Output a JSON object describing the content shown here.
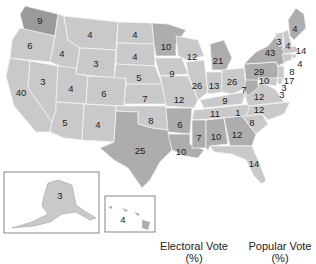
{
  "colors": {
    "light": "#c9c9c9",
    "medium": "#adadad",
    "dark": "#9a9a9a",
    "border": "#f2f2f2",
    "text": "#222222"
  },
  "states": [
    {
      "id": "WA",
      "votes": "9"
    },
    {
      "id": "OR",
      "votes": "6"
    },
    {
      "id": "CA",
      "votes": "40"
    },
    {
      "id": "ID",
      "votes": "4"
    },
    {
      "id": "NV",
      "votes": "3"
    },
    {
      "id": "MT",
      "votes": "4"
    },
    {
      "id": "WY",
      "votes": "3"
    },
    {
      "id": "UT",
      "votes": "4"
    },
    {
      "id": "CO",
      "votes": "6"
    },
    {
      "id": "AZ",
      "votes": "5"
    },
    {
      "id": "NM",
      "votes": "4"
    },
    {
      "id": "ND",
      "votes": "4"
    },
    {
      "id": "SD",
      "votes": "4"
    },
    {
      "id": "NE",
      "votes": "5"
    },
    {
      "id": "KS",
      "votes": "7"
    },
    {
      "id": "OK",
      "votes": "8"
    },
    {
      "id": "TX",
      "votes": "25"
    },
    {
      "id": "MN",
      "votes": "10"
    },
    {
      "id": "IA",
      "votes": "9"
    },
    {
      "id": "MO",
      "votes": "12"
    },
    {
      "id": "AR",
      "votes": "6"
    },
    {
      "id": "LA",
      "votes": "10"
    },
    {
      "id": "WI",
      "votes": "12"
    },
    {
      "id": "IL",
      "votes": "26"
    },
    {
      "id": "MI",
      "votes": "21"
    },
    {
      "id": "IN",
      "votes": "13"
    },
    {
      "id": "OH",
      "votes": "26"
    },
    {
      "id": "KY",
      "votes": "9"
    },
    {
      "id": "TN",
      "votes": "11"
    },
    {
      "id": "MS",
      "votes": "7"
    },
    {
      "id": "AL",
      "votes": "10"
    },
    {
      "id": "GA",
      "votes": "12"
    },
    {
      "id": "FL",
      "votes": "14"
    },
    {
      "id": "SC",
      "votes": "8"
    },
    {
      "id": "NC",
      "votes": "12"
    },
    {
      "id": "VA",
      "votes": "12"
    },
    {
      "id": "WV",
      "votes": "7"
    },
    {
      "id": "PA",
      "votes": "29"
    },
    {
      "id": "NY",
      "votes": "43"
    },
    {
      "id": "VT",
      "votes": "3"
    },
    {
      "id": "NH",
      "votes": "4"
    },
    {
      "id": "ME",
      "votes": "4"
    },
    {
      "id": "MA",
      "votes": "14"
    },
    {
      "id": "RI",
      "votes": "4"
    },
    {
      "id": "CT",
      "votes": "8"
    },
    {
      "id": "NJ",
      "votes": "17"
    },
    {
      "id": "DE",
      "votes": "3"
    },
    {
      "id": "MD",
      "votes": "10"
    },
    {
      "id": "DC",
      "votes": "3"
    },
    {
      "id": "DC_extra",
      "votes": "1"
    },
    {
      "id": "AK",
      "votes": "3"
    },
    {
      "id": "HI",
      "votes": "4"
    }
  ],
  "legend": {
    "electoral_label": "Electoral Vote",
    "electoral_unit": "(%)",
    "popular_label": "Popular Vote",
    "popular_unit": "(%)"
  }
}
